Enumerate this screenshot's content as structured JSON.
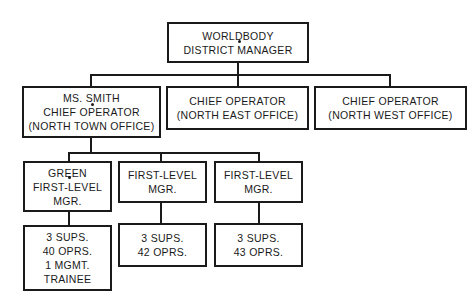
{
  "diagram": {
    "type": "org-chart",
    "root": {
      "lines": [
        "WORLDBODY",
        "DISTRICT MANAGER"
      ]
    },
    "chief_operators": [
      {
        "lines": [
          "MS. SMITH",
          "CHIEF OPERATOR",
          "(NORTH TOWN OFFICE)"
        ]
      },
      {
        "lines": [
          "CHIEF OPERATOR",
          "(NORTH EAST OFFICE)"
        ]
      },
      {
        "lines": [
          "CHIEF OPERATOR",
          "(NORTH WEST OFFICE)"
        ]
      }
    ],
    "first_level_managers": [
      {
        "lines": [
          "GREEN",
          "FIRST-LEVEL",
          "MGR."
        ]
      },
      {
        "lines": [
          "FIRST-LEVEL",
          "MGR."
        ]
      },
      {
        "lines": [
          "FIRST-LEVEL",
          "MGR."
        ]
      }
    ],
    "staff": [
      {
        "lines": [
          "3 SUPS.",
          "40 OPRS.",
          "1 MGMT.",
          "TRAINEE"
        ]
      },
      {
        "lines": [
          "3 SUPS.",
          "42 OPRS."
        ]
      },
      {
        "lines": [
          "3 SUPS.",
          "43 OPRS."
        ]
      }
    ],
    "colors": {
      "line": "#1a1a1a",
      "background": "#ffffff"
    }
  }
}
